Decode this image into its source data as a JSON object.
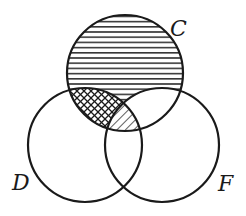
{
  "diagram": {
    "type": "venn",
    "sets": [
      {
        "name": "C",
        "label": "C",
        "cx": 125,
        "cy": 73,
        "r": 58
      },
      {
        "name": "D",
        "label": "D",
        "cx": 85,
        "cy": 145,
        "r": 57
      },
      {
        "name": "F",
        "label": "F",
        "cx": 162,
        "cy": 145,
        "r": 57
      }
    ],
    "shading": [
      {
        "region": "C only (not D, not F)",
        "pattern": "horizontal-lines"
      },
      {
        "region": "C ∩ D, not F",
        "pattern": "cross-hatch"
      },
      {
        "region": "C ∩ D ∩ F",
        "pattern": "diagonal-lines"
      }
    ],
    "colors": {
      "stroke": "#1a1a1a",
      "background": "#ffffff"
    }
  }
}
